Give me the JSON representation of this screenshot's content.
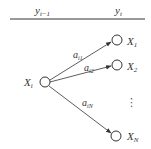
{
  "header": {
    "left_label": {
      "base": "y",
      "sub": "t−1"
    },
    "right_label": {
      "base": "y",
      "sub": "t"
    }
  },
  "source_node": {
    "base": "X",
    "sub": "i"
  },
  "target_nodes": [
    {
      "base": "X",
      "sub": "1"
    },
    {
      "base": "X",
      "sub": "2"
    },
    {
      "base": "X",
      "sub": "N"
    }
  ],
  "edges": [
    {
      "base": "a",
      "sub": "i1"
    },
    {
      "base": "a",
      "sub": "i2"
    },
    {
      "base": "a",
      "sub": "iN"
    }
  ],
  "ellipsis": "⋮",
  "colors": {
    "stroke": "#333333",
    "background": "#ffffff"
  }
}
